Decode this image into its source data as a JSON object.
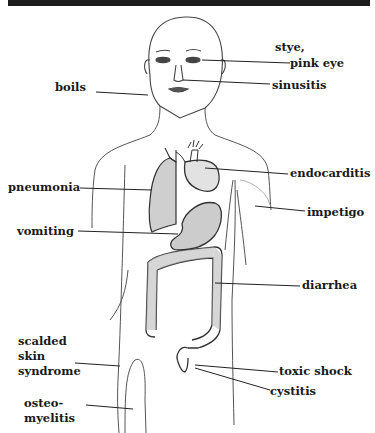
{
  "diagram": {
    "type": "anatomical-labeled-figure",
    "labels": {
      "stye": "stye,",
      "pink_eye": "pink eye",
      "sinusitis": "sinusitis",
      "boils": "boils",
      "endocarditis": "endocarditis",
      "pneumonia": "pneumonia",
      "impetigo": "impetigo",
      "vomiting": "vomiting",
      "diarrhea": "diarrhea",
      "scalded_line1": "scalded",
      "scalded_line2": "skin",
      "scalded_line3": "syndrome",
      "toxic_shock": "toxic shock",
      "cystitis": "cystitis",
      "osteo_line1": "osteo-",
      "osteo_line2": "myelitis"
    },
    "organs": [
      "head",
      "lung",
      "heart",
      "stomach",
      "large intestine",
      "bladder region",
      "leg"
    ],
    "colors": {
      "line": "#2a2a2a",
      "sketch": "#555555",
      "shade": "#888888",
      "header_bar": "#1c1c1c"
    }
  }
}
